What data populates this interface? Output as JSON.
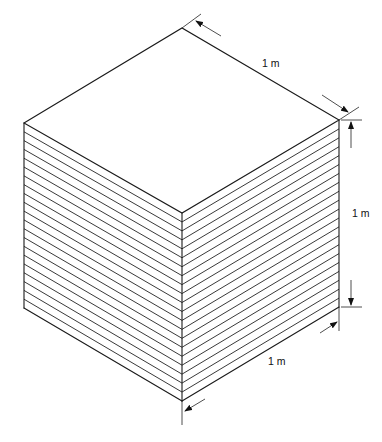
{
  "figure": {
    "layer_count": 21,
    "dimensions": [
      {
        "id": "top-depth",
        "label": "1 m"
      },
      {
        "id": "height",
        "label": "1 m"
      },
      {
        "id": "bottom-width",
        "label": "1 m"
      }
    ]
  },
  "colors": {
    "line": "#1a1a1a",
    "background": "#ffffff"
  }
}
